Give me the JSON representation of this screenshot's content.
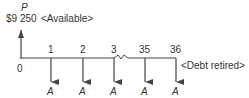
{
  "diagram": {
    "type": "cash-flow-diagram",
    "present_value": {
      "symbol": "P",
      "amount": "$9 250",
      "note": "<Available>"
    },
    "timeline": {
      "start_label": "0",
      "periods": [
        "1",
        "2",
        "3",
        "35",
        "36"
      ],
      "break_between": [
        "3",
        "35"
      ],
      "end_note": "<Debt retired>"
    },
    "payments": {
      "symbol": "A",
      "labels": [
        "A",
        "A",
        "A",
        "A",
        "A"
      ]
    },
    "colors": {
      "line": "#444444",
      "text": "#333333"
    }
  }
}
